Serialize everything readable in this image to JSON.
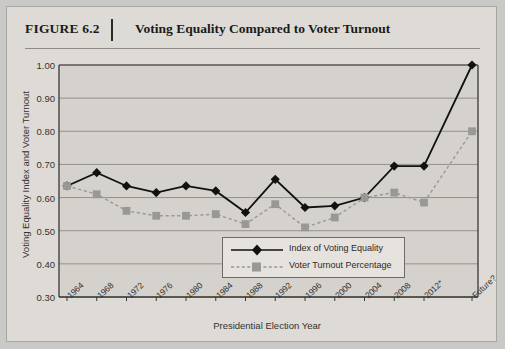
{
  "figure": {
    "number_label": "FIGURE 6.2",
    "title": "Voting Equality Compared to Voter Turnout"
  },
  "chart_data": {
    "type": "line",
    "title": "Voting Equality Compared to Voter Turnout",
    "xlabel": "Presidential Election Year",
    "ylabel": "Voting Equality Index and Voter Turnout",
    "categories": [
      "1964",
      "1968",
      "1972",
      "1976",
      "1980",
      "1984",
      "1988",
      "1992",
      "1996",
      "2000",
      "2004",
      "2008",
      "2012*",
      "Future?"
    ],
    "series": [
      {
        "name": "Index of Voting Equality",
        "marker": "diamond",
        "color": "#111111",
        "linestyle": "solid",
        "values": [
          0.635,
          0.675,
          0.635,
          0.615,
          0.635,
          0.62,
          0.555,
          0.655,
          0.57,
          0.575,
          0.6,
          0.695,
          0.695,
          1.0
        ]
      },
      {
        "name": "Voter Turnout Percentage",
        "marker": "square",
        "color": "#9a9894",
        "linestyle": "dashed",
        "values": [
          0.635,
          0.61,
          0.56,
          0.545,
          0.545,
          0.55,
          0.52,
          0.58,
          0.51,
          0.54,
          0.6,
          0.615,
          0.585,
          0.8
        ]
      }
    ],
    "ylim": [
      0.3,
      1.0
    ],
    "yticks": [
      "0.30",
      "0.40",
      "0.50",
      "0.60",
      "0.70",
      "0.80",
      "0.90",
      "1.00"
    ],
    "grid": true,
    "legend_position": "inside-bottom-center"
  }
}
